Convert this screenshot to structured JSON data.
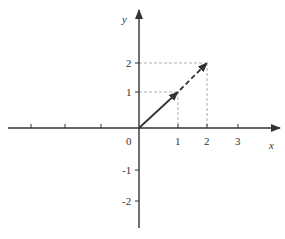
{
  "diagram": {
    "title": "",
    "axes": {
      "x_label": "x",
      "y_label": "y",
      "origin_label": "0",
      "x_tick_labels": [
        "1",
        "2",
        "3"
      ],
      "y_tick_labels_positive": [
        "1",
        "2"
      ],
      "y_tick_labels_negative": [
        "-1",
        "-2"
      ],
      "x_negative_ticks": 3
    },
    "vectors": [
      {
        "name": "v",
        "from": [
          0,
          0
        ],
        "to": [
          1,
          1
        ],
        "style": "solid"
      },
      {
        "name": "2v",
        "from": [
          1,
          1
        ],
        "to": [
          2,
          2
        ],
        "style": "dashed"
      }
    ],
    "guides": [
      {
        "from_point": [
          1,
          1
        ],
        "style": "dashed"
      },
      {
        "from_point": [
          2,
          2
        ],
        "style": "dashed"
      }
    ],
    "colors": {
      "axis": "#333333",
      "vector": "#333333",
      "guide": "#999999"
    }
  }
}
